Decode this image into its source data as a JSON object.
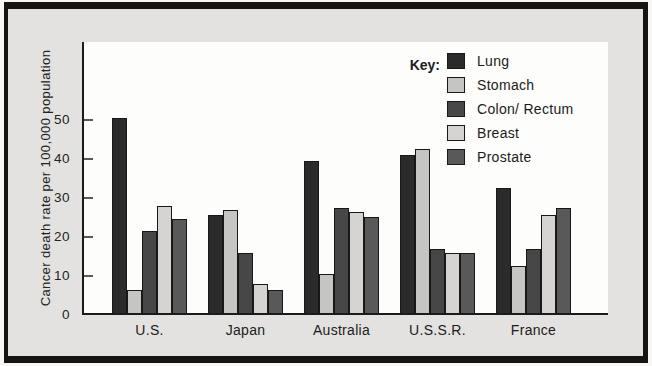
{
  "figure": {
    "panel_background": "#e4e2e0",
    "frame_color": "#141414",
    "plot_background": "#fdfdfc"
  },
  "chart_data": {
    "type": "bar",
    "title": "",
    "xlabel": "",
    "ylabel": "Cancer death rate per 100,000 population",
    "categories": [
      "U.S.",
      "Japan",
      "Australia",
      "U.S.S.R.",
      "France"
    ],
    "series": [
      {
        "name": "Lung",
        "color": "#2b2b2b",
        "values": [
          50,
          25,
          39,
          40.5,
          32
        ]
      },
      {
        "name": "Stomach",
        "color": "#c5c5c4",
        "values": [
          6,
          26.5,
          10,
          42,
          12
        ]
      },
      {
        "name": "Colon/ Rectum",
        "color": "#474747",
        "values": [
          21,
          15.5,
          27,
          16.5,
          16.5
        ]
      },
      {
        "name": "Breast",
        "color": "#d5d4d2",
        "values": [
          27.5,
          7.5,
          26,
          15.5,
          25
        ]
      },
      {
        "name": "Prostate",
        "color": "#595959",
        "values": [
          24,
          6,
          24.5,
          15.5,
          27
        ]
      }
    ],
    "yticks": [
      0,
      10,
      20,
      30,
      40,
      50
    ],
    "ylim": [
      0,
      70
    ],
    "grid": false,
    "legend": {
      "title": "Key:",
      "position": "top-right"
    }
  }
}
